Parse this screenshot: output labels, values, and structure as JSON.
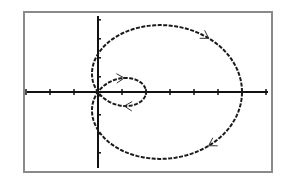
{
  "chart_data": {
    "type": "line",
    "subtype": "polar-parametric",
    "title": "",
    "xlabel": "",
    "ylabel": "",
    "equation": "r = 1 + 2cos(θ)",
    "curve": {
      "a": 1,
      "b": 2,
      "theta_range": [
        0,
        6.283185
      ],
      "direction": "counterclockwise"
    },
    "xlim": [
      -1.5,
      3.5
    ],
    "ylim": [
      -2.1,
      2.1
    ],
    "x_tick_step": 0.5,
    "y_tick_step": 0.5,
    "grid": false,
    "legend": null,
    "key_points": [
      {
        "label": "outer loop rightmost",
        "x": 3,
        "y": 0
      },
      {
        "label": "inner loop rightmost",
        "x": 1,
        "y": 0
      },
      {
        "label": "pole",
        "x": 0,
        "y": 0
      },
      {
        "label": "y-axis crossing top",
        "x": 0,
        "y": 1
      },
      {
        "label": "y-axis crossing bottom",
        "x": 0,
        "y": -1
      }
    ],
    "direction_arrows": [
      {
        "loop": "outer",
        "position": "top",
        "points": "right"
      },
      {
        "loop": "outer",
        "position": "bottom",
        "points": "right-up"
      },
      {
        "loop": "inner",
        "position": "top",
        "points": "left"
      },
      {
        "loop": "inner",
        "position": "bottom",
        "points": "right"
      }
    ]
  },
  "display": {
    "frame": {
      "left": 24,
      "top": 12,
      "right": 272,
      "bottom": 172
    },
    "origin_px": {
      "x": 98,
      "y": 92
    },
    "scale_px": {
      "x": 48,
      "y": 38
    },
    "colors": {
      "curve": "#1a1a1a",
      "axes": "#111111",
      "frame": "#8a8a8a",
      "background": "#ffffff"
    }
  }
}
